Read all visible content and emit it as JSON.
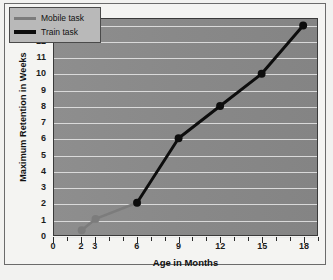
{
  "chart_data": {
    "type": "line",
    "title": "",
    "xlabel": "Age in Months",
    "ylabel": "Maximum Retention in Weeks",
    "xlim": [
      0,
      19
    ],
    "ylim": [
      0,
      13.4
    ],
    "grid": true,
    "legend_position": "top-left",
    "x_tick_labels": [
      "0",
      "2",
      "3",
      "6",
      "9",
      "12",
      "15",
      "18"
    ],
    "x_tick_values": [
      0,
      2,
      3,
      6,
      9,
      12,
      15,
      18
    ],
    "x_minor_ticks": [
      1,
      4,
      5,
      7,
      8,
      10,
      11,
      13,
      14,
      16,
      17,
      19
    ],
    "y_tick_labels": [
      "0",
      "1",
      "2",
      "3",
      "4",
      "5",
      "6",
      "7",
      "8",
      "9",
      "10",
      "11",
      "12",
      "13"
    ],
    "y_tick_values": [
      0,
      1,
      2,
      3,
      4,
      5,
      6,
      7,
      8,
      9,
      10,
      11,
      12,
      13
    ],
    "series": [
      {
        "name": "Mobile task",
        "color": "#7c7c7c",
        "x": [
          2,
          3,
          6
        ],
        "y": [
          0.3,
          1,
          2
        ]
      },
      {
        "name": "Train task",
        "color": "#0d0d0d",
        "x": [
          6,
          9,
          12,
          15,
          18
        ],
        "y": [
          2,
          6,
          8,
          10,
          13
        ]
      }
    ]
  },
  "legend": {
    "items": [
      {
        "label": "Mobile task",
        "color": "#7c7c7c",
        "weight": 3
      },
      {
        "label": "Train task",
        "color": "#0d0d0d",
        "weight": 4
      }
    ]
  },
  "axes": {
    "x_title": "Age in Months",
    "y_title": "Maximum Retention in Weeks"
  },
  "colors": {
    "plot_background": "#8a8a8a",
    "gridline": "#e8e8e8",
    "figure_background": "#f2f2f0",
    "frame_border": "#6b6b6b",
    "mobile_series": "#7c7c7c",
    "train_series": "#0d0d0d",
    "legend_background": "#b9b9b9"
  }
}
